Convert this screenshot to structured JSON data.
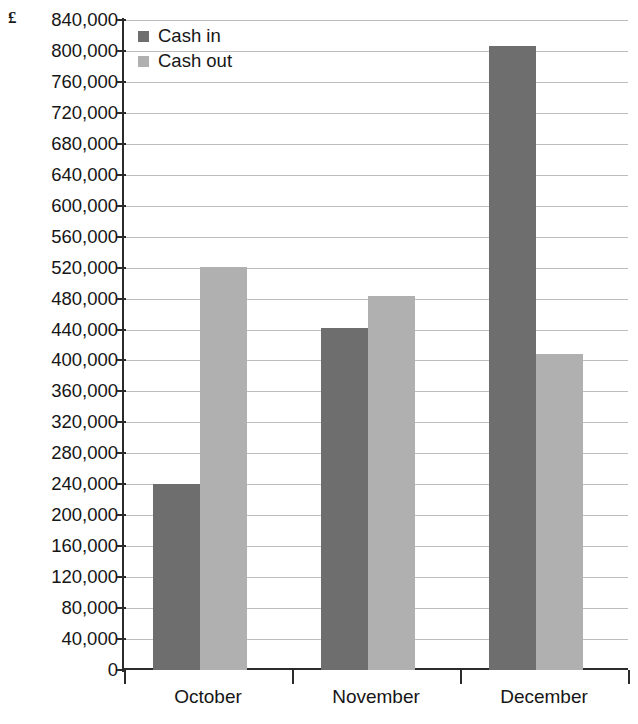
{
  "chart_data": {
    "type": "bar",
    "title": "",
    "xlabel": "",
    "ylabel": "£",
    "currency_symbol": "£",
    "categories": [
      "October",
      "November",
      "December"
    ],
    "series": [
      {
        "name": "Cash in",
        "color": "#6e6e6e",
        "values": [
          241000,
          442000,
          806000
        ]
      },
      {
        "name": "Cash out",
        "color": "#b0b0b0",
        "values": [
          521000,
          483000,
          409000
        ]
      }
    ],
    "ylim": [
      0,
      840000
    ],
    "ytick_step": 40000,
    "ytick_labels": [
      "840,000",
      "800,000",
      "760,000",
      "720,000",
      "680,000",
      "640,000",
      "600,000",
      "560,000",
      "520,000",
      "480,000",
      "440,000",
      "400,000",
      "360,000",
      "320,000",
      "280,000",
      "240,000",
      "200,000",
      "160,000",
      "120,000",
      "80,000",
      "40,000",
      "0"
    ],
    "ytick_values": [
      840000,
      800000,
      760000,
      720000,
      680000,
      640000,
      600000,
      560000,
      520000,
      480000,
      440000,
      400000,
      360000,
      320000,
      280000,
      240000,
      200000,
      160000,
      120000,
      80000,
      40000,
      0
    ],
    "grid": true,
    "legend_position": "top-left-inside",
    "legend": [
      {
        "label": "Cash in",
        "color": "#6e6e6e"
      },
      {
        "label": "Cash out",
        "color": "#b0b0b0"
      }
    ]
  }
}
